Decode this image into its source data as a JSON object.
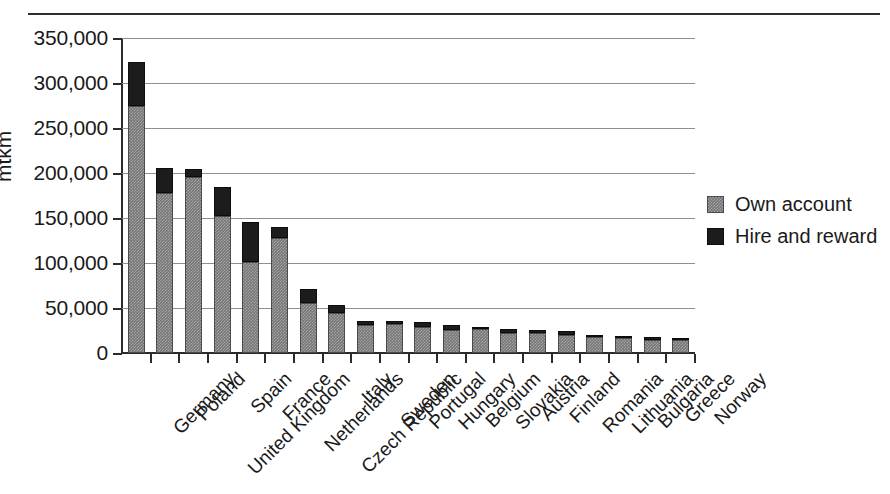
{
  "chart_data": {
    "type": "bar",
    "subtype": "stacked-vertical",
    "title": "",
    "xlabel": "",
    "ylabel": "mtkm",
    "ylim": [
      0,
      350000
    ],
    "yticks": [
      0,
      50000,
      100000,
      150000,
      200000,
      250000,
      300000,
      350000
    ],
    "ytick_labels": [
      "0",
      "50,000",
      "100,000",
      "150,000",
      "200,000",
      "250,000",
      "300,000",
      "350,000"
    ],
    "grid": true,
    "grid_axis": "y",
    "legend_position": "right",
    "categories": [
      "Germany",
      "Poland",
      "United Kingdom",
      "Spain",
      "France",
      "Netherlands",
      "Czech Republic",
      "Italy",
      "Sweden",
      "Portugal",
      "Hungary",
      "Belgium",
      "Slovakia",
      "Austria",
      "Finland",
      "Romania",
      "Lithuania",
      "Bulgaria",
      "Greece",
      "Norway"
    ],
    "series": [
      {
        "name": "Own account",
        "color": "#767676",
        "values": [
          274000,
          178000,
          196000,
          152000,
          101000,
          128000,
          56000,
          45000,
          31000,
          32000,
          29000,
          26000,
          27000,
          22000,
          22000,
          20000,
          18000,
          17000,
          15000,
          14000
        ]
      },
      {
        "name": "Hire and reward",
        "color": "#1c1c1c",
        "values": [
          49000,
          28000,
          8000,
          32000,
          45000,
          12000,
          15000,
          8000,
          5000,
          4000,
          5000,
          5000,
          2000,
          5000,
          4000,
          4000,
          2000,
          2000,
          3000,
          3000
        ]
      }
    ],
    "totals": [
      323000,
      206000,
      204000,
      184000,
      146000,
      140000,
      71000,
      53000,
      36000,
      36000,
      34000,
      31000,
      29000,
      27000,
      26000,
      24000,
      20000,
      19000,
      18000,
      17000
    ]
  },
  "legend": {
    "items": [
      {
        "label": "Own account",
        "swatch": "own-account-swatch"
      },
      {
        "label": "Hire and reward",
        "swatch": "hire-and-reward-swatch"
      }
    ]
  },
  "axis": {
    "y_title": "mtkm"
  }
}
